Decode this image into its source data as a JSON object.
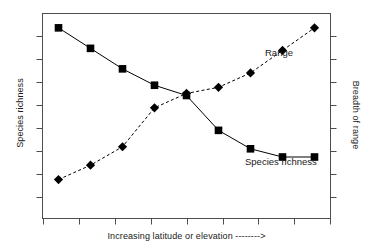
{
  "figure": {
    "background_color": "#ffffff",
    "axis_color": "#4d4d4d",
    "series_color": "#000000"
  },
  "axes": {
    "left_title": "Species richness",
    "right_title": "Breadth of range",
    "bottom_title": "Increasing latitude or elevation -------->"
  },
  "annotations": {
    "range_label": "Range",
    "species_richness_label": "Species richness"
  },
  "chart_data": {
    "type": "line",
    "title": "",
    "subtitle": "",
    "xlabel": "Increasing latitude or elevation -------->",
    "ylabel": "Species richness",
    "y2label": "Breadth of range",
    "grid": false,
    "legend_position": "inline-annotations",
    "x": [
      1,
      2,
      3,
      4,
      5,
      6,
      7,
      8,
      9
    ],
    "xticklabels": [
      "",
      "",
      "",
      "",
      "",
      "",
      "",
      "",
      ""
    ],
    "yticklabels": [],
    "xlim": [
      0.5,
      9.5
    ],
    "ylim": [
      0,
      100
    ],
    "series": [
      {
        "name": "Species richness",
        "axis": "left",
        "marker": "square",
        "linestyle": "solid",
        "color": "#000000",
        "values": [
          93,
          83,
          73,
          65,
          60,
          43,
          34,
          30,
          30
        ]
      },
      {
        "name": "Range",
        "axis": "right",
        "marker": "diamond",
        "linestyle": "dashed",
        "color": "#000000",
        "values": [
          19,
          26,
          35,
          54,
          61,
          64,
          71,
          82,
          93
        ]
      }
    ]
  }
}
